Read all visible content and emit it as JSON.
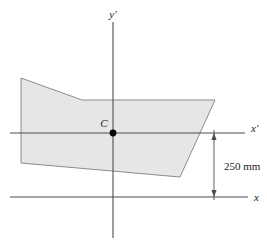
{
  "figure": {
    "type": "engineering-cross-section-diagram",
    "background_color": "#ffffff",
    "shape": {
      "name": "cross-section-region",
      "fill_color": "#e6e6e6",
      "stroke_color": "#8c8c8c",
      "vertices": "21,78 82,100 215,100 180,177 21,163"
    },
    "axes": {
      "x_prime": {
        "label": "x′",
        "label_plain": "x'",
        "color": "#4d4d4d",
        "line": "10,133 245,133"
      },
      "y_prime": {
        "label": "y′",
        "label_plain": "y'",
        "color": "#4d4d4d",
        "line": "113,22 113,238"
      },
      "x": {
        "label": "x",
        "label_plain": "x",
        "color": "#4d4d4d",
        "line": "10,197 248,197"
      }
    },
    "centroid": {
      "label": "C",
      "marker_color": "#000000",
      "cx": 113,
      "cy": 133
    },
    "dimension": {
      "name": "vertical-offset",
      "text": "250 mm",
      "color": "#4d4d4d",
      "line": "214,133 214,197"
    }
  }
}
